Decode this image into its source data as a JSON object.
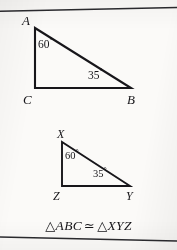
{
  "page": {
    "width": 177,
    "height": 250,
    "background_color": "#fbfaf8",
    "ink_color": "#17161a"
  },
  "rules": {
    "top_label": "horizontal rule",
    "bottom_label": "horizontal rule"
  },
  "figures": [
    {
      "id": "triangle-abc",
      "name": "Triangle ABC",
      "vertices": [
        {
          "key": "A",
          "label": "A",
          "x": 35,
          "y": 28,
          "label_x": 22,
          "label_y": 14
        },
        {
          "key": "C",
          "label": "C",
          "x": 35,
          "y": 88,
          "label_x": 23,
          "label_y": 93
        },
        {
          "key": "B",
          "label": "B",
          "x": 131,
          "y": 88,
          "label_x": 127,
          "label_y": 93
        }
      ],
      "angles": [
        {
          "at": "A",
          "value": "60",
          "unit": "°",
          "label_x": 38,
          "label_y": 39
        },
        {
          "at": "B",
          "value": "35",
          "unit": "°",
          "label_x": 88,
          "label_y": 70
        }
      ]
    },
    {
      "id": "triangle-xyz",
      "name": "Triangle XYZ",
      "vertices": [
        {
          "key": "X",
          "label": "X",
          "x": 62,
          "y": 142,
          "label_x": 57,
          "label_y": 128
        },
        {
          "key": "Z",
          "label": "Z",
          "x": 62,
          "y": 186,
          "label_x": 53,
          "label_y": 190
        },
        {
          "key": "Y",
          "label": "Y",
          "x": 130,
          "y": 186,
          "label_x": 126,
          "label_y": 190
        }
      ],
      "angles": [
        {
          "at": "X",
          "value": "60",
          "unit": "°",
          "label_x": 65,
          "label_y": 151
        },
        {
          "at": "Y",
          "value": "35",
          "unit": "°",
          "label_x": 93,
          "label_y": 169
        }
      ]
    }
  ],
  "caption": {
    "triangle_symbol": "△",
    "left_triangle": "ABC",
    "congruence_symbol": "≃",
    "right_triangle": "XYZ",
    "full_text": "△ABC ≃ △XYZ"
  }
}
